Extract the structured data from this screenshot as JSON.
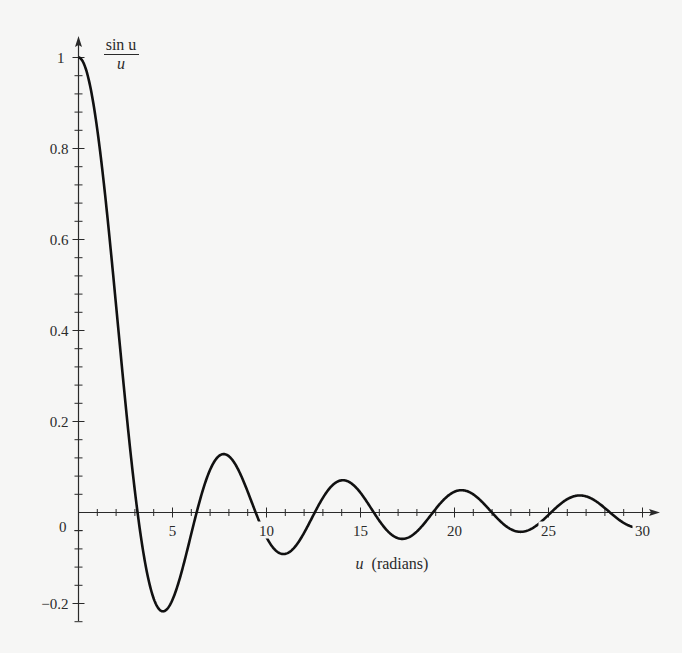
{
  "chart_data": {
    "type": "line",
    "title_numerator": "sin u",
    "title_denominator": "u",
    "xlabel": "u (radians)",
    "xlabel_var": "u",
    "xlabel_unit": "(radians)",
    "ylabel": "sin u / u",
    "xlim": [
      0,
      30.5
    ],
    "ylim": [
      -0.24,
      1.05
    ],
    "x_ticks_major": [
      5,
      10,
      15,
      20,
      25,
      30
    ],
    "x_tick_labels": [
      "5",
      "10",
      "15",
      "20",
      "25",
      "30"
    ],
    "x_minor_step": 1,
    "y_ticks_major": [
      -0.2,
      0,
      0.2,
      0.4,
      0.6,
      0.8,
      1
    ],
    "y_tick_labels": [
      "−0.2",
      "0",
      "0.2",
      "0.4",
      "0.6",
      "0.8",
      "1"
    ],
    "y_minor_step": 0.04,
    "grid": false,
    "legend": null,
    "series": [
      {
        "name": "sin u / u",
        "function": "sinc",
        "x_range": [
          0,
          29.6
        ],
        "key_points": [
          {
            "x": 0,
            "y": 1
          },
          {
            "x": 3.1416,
            "y": 0
          },
          {
            "x": 4.493,
            "y": -0.217
          },
          {
            "x": 6.2832,
            "y": 0
          },
          {
            "x": 7.725,
            "y": 0.128
          },
          {
            "x": 9.4248,
            "y": 0
          },
          {
            "x": 10.904,
            "y": -0.091
          },
          {
            "x": 12.566,
            "y": 0
          },
          {
            "x": 14.066,
            "y": 0.071
          },
          {
            "x": 15.708,
            "y": 0
          },
          {
            "x": 17.221,
            "y": -0.058
          },
          {
            "x": 18.85,
            "y": 0
          },
          {
            "x": 20.371,
            "y": 0.049
          },
          {
            "x": 21.991,
            "y": 0
          },
          {
            "x": 23.519,
            "y": -0.042
          },
          {
            "x": 25.133,
            "y": 0
          },
          {
            "x": 26.666,
            "y": 0.037
          },
          {
            "x": 28.274,
            "y": 0
          },
          {
            "x": 29.6,
            "y": -0.03
          }
        ]
      }
    ]
  }
}
